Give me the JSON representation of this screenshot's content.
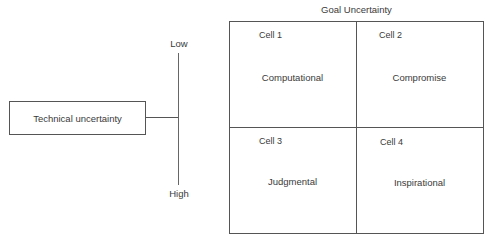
{
  "grid": {
    "title": "Goal Uncertainty",
    "cells": [
      {
        "number": "Cell 1",
        "name": "Computational"
      },
      {
        "number": "Cell 2",
        "name": "Compromise"
      },
      {
        "number": "Cell 3",
        "name": "Judgmental"
      },
      {
        "number": "Cell 4",
        "name": "Inspirational"
      }
    ]
  },
  "technical": {
    "label": "Technical uncertainty",
    "axis": {
      "top_label": "Low",
      "bottom_label": "High"
    }
  },
  "colors": {
    "line": "#555555",
    "text": "#3a3a3a",
    "background": "#ffffff"
  }
}
